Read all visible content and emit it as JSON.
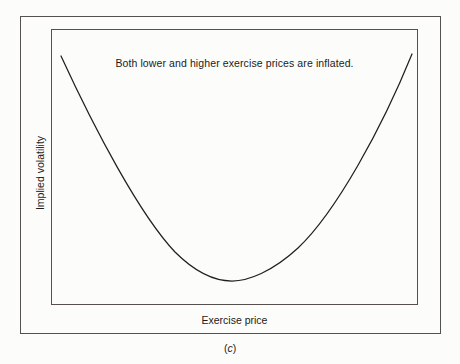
{
  "figure": {
    "caption_prefix": "(",
    "caption_letter": "c",
    "caption_suffix": ")",
    "annotation": "Both lower and higher exercise prices are inflated.",
    "x_axis_label": "Exercise price",
    "y_axis_label": "Implied volatility",
    "line_color": "#231f20",
    "frame_color": "#555052",
    "background_color": "#fcfcfb"
  },
  "chart_data": {
    "type": "line",
    "title": "",
    "subtitle": "",
    "xlabel": "Exercise price",
    "ylabel": "Implied volatility",
    "annotations": [
      {
        "text": "Both lower and higher exercise prices are inflated.",
        "position": "top-center"
      }
    ],
    "grid": false,
    "legend": false,
    "axis_ticks": false,
    "xlim": [
      0,
      1
    ],
    "ylim": [
      0,
      1
    ],
    "series": [
      {
        "name": "Implied volatility smile",
        "shape": "u-curve",
        "minimum_x": 0.49,
        "minimum_y": 0.09,
        "x": [
          0.03,
          0.1,
          0.17,
          0.24,
          0.31,
          0.38,
          0.45,
          0.49,
          0.55,
          0.62,
          0.69,
          0.76,
          0.83,
          0.9,
          0.98
        ],
        "y": [
          0.9,
          0.71,
          0.55,
          0.41,
          0.29,
          0.19,
          0.11,
          0.09,
          0.11,
          0.18,
          0.28,
          0.4,
          0.54,
          0.71,
          0.91
        ]
      }
    ],
    "svg_path": "M 61 56 C 95 130 140 215 175 252 C 200 277 220 281 232 281 C 248 281 272 272 298 248 C 336 212 382 128 412 54"
  }
}
